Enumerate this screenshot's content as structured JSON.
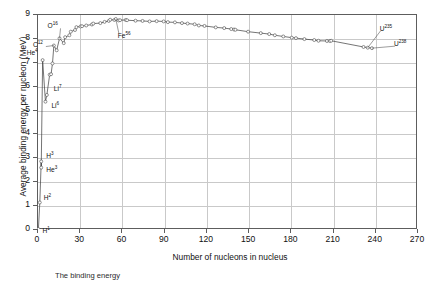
{
  "chart_data": {
    "type": "line",
    "title": "",
    "xlabel": "Number of nucleons in nucleus",
    "ylabel": "Average binding energy per nucleon (MeV)",
    "xlim": [
      0,
      270
    ],
    "ylim": [
      0,
      9
    ],
    "xticks": [
      0,
      30,
      60,
      90,
      120,
      150,
      180,
      210,
      240,
      270
    ],
    "yticks": [
      0,
      1,
      2,
      3,
      4,
      5,
      6,
      7,
      8,
      9
    ],
    "grid": true,
    "legend": "none",
    "marker": "open-circle",
    "series_name": "Binding energy per nucleon",
    "x": [
      1,
      2,
      3,
      3,
      4,
      6,
      7,
      9,
      10,
      11,
      12,
      14,
      16,
      19,
      20,
      23,
      24,
      27,
      28,
      31,
      32,
      35,
      39,
      40,
      45,
      48,
      51,
      52,
      55,
      56,
      58,
      59,
      63,
      64,
      70,
      75,
      80,
      85,
      90,
      93,
      98,
      103,
      107,
      112,
      115,
      119,
      127,
      133,
      138,
      140,
      141,
      150,
      159,
      165,
      169,
      175,
      181,
      184,
      190,
      197,
      200,
      206,
      208,
      209,
      232,
      235,
      238
    ],
    "y": [
      0.0,
      1.11,
      2.83,
      2.57,
      7.07,
      5.33,
      5.61,
      6.46,
      6.48,
      6.93,
      7.68,
      7.48,
      7.98,
      7.78,
      8.03,
      8.11,
      8.26,
      8.33,
      8.45,
      8.48,
      8.49,
      8.52,
      8.56,
      8.6,
      8.62,
      8.67,
      8.71,
      8.76,
      8.75,
      8.79,
      8.73,
      8.74,
      8.75,
      8.74,
      8.72,
      8.71,
      8.69,
      8.7,
      8.69,
      8.66,
      8.65,
      8.62,
      8.6,
      8.57,
      8.52,
      8.5,
      8.44,
      8.41,
      8.37,
      8.35,
      8.34,
      8.26,
      8.2,
      8.16,
      8.11,
      8.06,
      8.01,
      7.99,
      7.95,
      7.91,
      7.88,
      7.87,
      7.87,
      7.88,
      7.62,
      7.59,
      7.57
    ],
    "annotations": [
      {
        "id": "h1",
        "base": "H",
        "sup": "1",
        "x": 1,
        "y": 0.0
      },
      {
        "id": "h2",
        "base": "H",
        "sup": "2",
        "x": 2,
        "y": 1.11
      },
      {
        "id": "h3",
        "base": "H",
        "sup": "3",
        "x": 3,
        "y": 2.83
      },
      {
        "id": "he3",
        "base": "He",
        "sup": "3",
        "x": 3,
        "y": 2.57
      },
      {
        "id": "he4",
        "base": "He",
        "sup": "4",
        "x": 4,
        "y": 7.07
      },
      {
        "id": "li6",
        "base": "Li",
        "sup": "6",
        "x": 6,
        "y": 5.33
      },
      {
        "id": "li7",
        "base": "Li",
        "sup": "7",
        "x": 7,
        "y": 5.61
      },
      {
        "id": "c12",
        "base": "C",
        "sup": "12",
        "x": 12,
        "y": 7.68
      },
      {
        "id": "o16",
        "base": "O",
        "sup": "16",
        "x": 16,
        "y": 7.98
      },
      {
        "id": "fe56",
        "base": "Fe",
        "sup": "56",
        "x": 56,
        "y": 8.79
      },
      {
        "id": "u235",
        "base": "U",
        "sup": "235",
        "x": 235,
        "y": 7.59
      },
      {
        "id": "u238",
        "base": "U",
        "sup": "238",
        "x": 238,
        "y": 7.57
      }
    ],
    "colors": {
      "curve": "#3a3a3a",
      "marker_edge": "#3a3a3a",
      "marker_fill": "#ffffff",
      "grid": "#c9c9c9",
      "frame": "#5d5d5d",
      "text": "#111111"
    }
  },
  "caption": "The binding energy"
}
